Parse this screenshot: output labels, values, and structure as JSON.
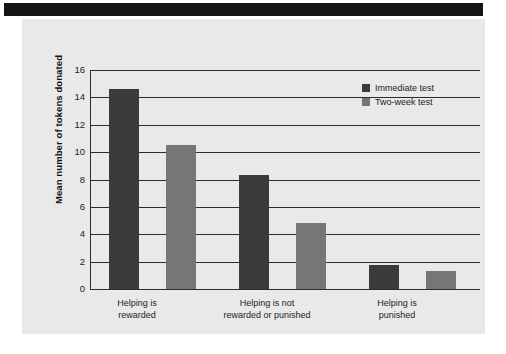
{
  "figure": {
    "background_color": "#ffffff",
    "panel_color": "#e9e9e9",
    "band_color": "#151515"
  },
  "chart_data": {
    "type": "bar",
    "title": "",
    "subtitle": "",
    "xlabel": "",
    "ylabel": "Mean number of tokens donated",
    "ylim": [
      0,
      16
    ],
    "yticks": [
      0,
      2,
      4,
      6,
      8,
      10,
      12,
      14,
      16
    ],
    "ytick_labels": [
      "0",
      "2",
      "4",
      "6",
      "8",
      "10",
      "12",
      "14",
      "16"
    ],
    "grid": true,
    "grid_axis": "y",
    "legend_position": "upper right",
    "categories": [
      "Helping is\nrewarded",
      "Helping is not\nrewarded or punished",
      "Helping is\npunished"
    ],
    "series": [
      {
        "name": "Immediate test",
        "color": "#3b3b3b",
        "values": [
          14.6,
          8.3,
          1.75
        ]
      },
      {
        "name": "Two-week test",
        "color": "#767676",
        "values": [
          10.5,
          4.85,
          1.3
        ]
      }
    ]
  }
}
